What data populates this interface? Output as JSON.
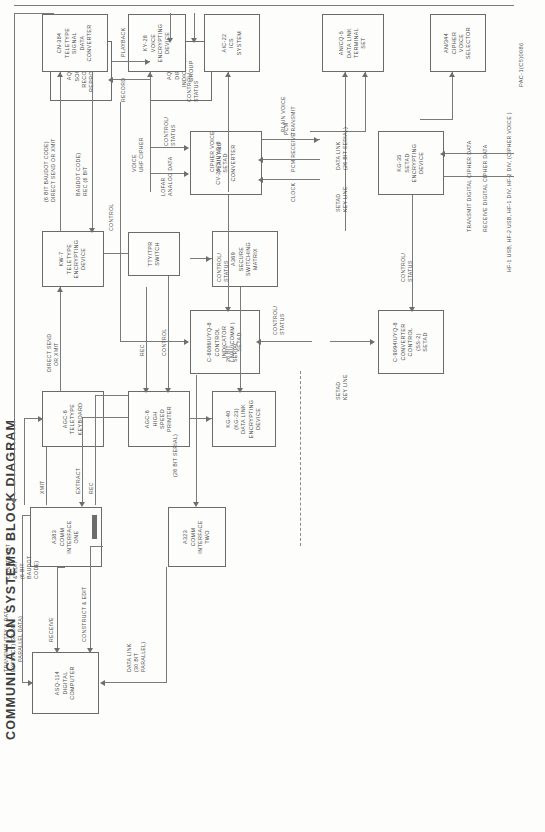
{
  "document": {
    "title": "COMMUNICATION SYSTEMS BLOCK DIAGRAM",
    "figure_code": "PAC-1(C5)0086"
  },
  "boxes": {
    "asq114": {
      "lines": [
        "ASQ-114",
        "DIGITAL",
        "COMPUTER"
      ]
    },
    "a383": {
      "lines": [
        "A383",
        "COMM",
        "INTERFACE",
        "ONE"
      ]
    },
    "a323": {
      "lines": [
        "A323",
        "COMM",
        "INTERFACE",
        "TWO"
      ]
    },
    "agc6kb": {
      "lines": [
        "AGC-6",
        "TELETYPE",
        "KEYBOARD"
      ]
    },
    "agc6pr": {
      "lines": [
        "AGC-6",
        "HIGH",
        "SPEED",
        "PRINTER"
      ]
    },
    "kg40": {
      "lines": [
        "KG-40",
        "(KG-23)",
        "DATA LINK",
        "ENCRYPTING",
        "DEVICE"
      ]
    },
    "kw7": {
      "lines": [
        "KW-7",
        "TELETYPE",
        "ENCRYPTING",
        "DEVICE"
      ]
    },
    "ttytpr": {
      "lines": [
        "TTY/TPR",
        "SWITCH"
      ]
    },
    "a369": {
      "lines": [
        "A369",
        "SECURE",
        "SWITCHING",
        "MATRIX"
      ]
    },
    "cn384": {
      "lines": [
        "CN-384",
        "TELETYPE",
        "SIGNAL",
        "DATA",
        "CONVERTER"
      ]
    },
    "ky28": {
      "lines": [
        "KY-28",
        "VOICE",
        "ENCRYPTING",
        "DEVICE"
      ]
    },
    "aic22": {
      "lines": [
        "AIC-22",
        "ICS",
        "SYSTEM"
      ]
    },
    "ancq5": {
      "lines": [
        "AN/CQ-5",
        "DATA LINK",
        "TERMINAL",
        "SET"
      ]
    },
    "an344": {
      "lines": [
        "AN/344",
        "CIPHER",
        "VOICE",
        "SELECTOR"
      ]
    },
    "c8086": {
      "lines": [
        "C-8086/UYQ-8",
        "CONTROL",
        "INDICATOR",
        "( NAV/COMM )",
        "SETAD"
      ]
    },
    "c9094": {
      "lines": [
        "C-9094/UYQ-8",
        "CONVERTER",
        "CONTROL",
        "(SS-2)",
        "SETAD"
      ]
    },
    "cv2975": {
      "lines": [
        "CV-2975/UYQ-8",
        "SETAD",
        "CONVERTER"
      ]
    },
    "kg35": {
      "lines": [
        "KG-35",
        "SETAD",
        "ENCRYPTING",
        "DEVICE"
      ]
    },
    "aqh4": {
      "lines": [
        "AQH-4",
        "SOUND",
        "RECORDER",
        "REPRODUCER"
      ]
    },
    "aqa7": {
      "lines": [
        "AQA-7",
        "DIFAR",
        "INDICATOR",
        "GROUP"
      ]
    }
  },
  "labels": {
    "transmit_tty_data": "TRANSMIT (TTY & DATA",
    "extract_30bit": "EXTRACT) (30 BIT",
    "parallel_data": "PARALLEL DATA)",
    "receive": "RECEIVE",
    "construct_edit": "CONSTRUCT & EDIT",
    "data_link_30bit": "DATA LINK",
    "data_link_30bit_2": "(30 BIT",
    "data_link_30bit_3": "PARALLEL)",
    "construct_edit_2a": "CONSTRUCT",
    "construct_edit_2b": "& EDIT",
    "baudot_16a": "(6 BIT",
    "baudot_16b": "BAUDOT",
    "baudot_16c": "CODE)",
    "xmit": "XMIT",
    "extract": "EXTRACT",
    "rec": "REC",
    "rec2": "REC",
    "direct_send_xmit_a": "DIRECT SEND",
    "direct_send_xmit_b": "OR XMIT",
    "control": "CONTROL",
    "control_b": "CONTROL",
    "ttytpr_control": "CONTROL",
    "bit26serial_a": "26 BIT",
    "bit26serial_b": "SERIAL",
    "bit26serial_paren": "(26 BIT SERIAL)",
    "setad_key_line_a": "SETAD",
    "setad_key_line_b": "KEY LINE",
    "setad_key_line2_a": "SETAD",
    "setad_key_line2_b": "KEY LINE",
    "data_link_26_a": "DATA LINK",
    "data_link_26_b": "(26 BIT SERIAL)",
    "direct_send_or_xmit_a": "DIRECT SEND OR XMIT",
    "direct_send_or_xmit_b": "(6 BIT BAUDOT CODE)",
    "rec_6bit_a": "REC (6 BIT",
    "rec_6bit_b": "BAUDOT CODE)",
    "uhf_cipher_a": "UHF CIPHER",
    "uhf_cipher_b": "VOICE",
    "plain_cipher_a": "PLAIN AND",
    "plain_cipher_b": "CIPHER VOICE",
    "plain_voice": "PLAIN VOICE",
    "control_status_1": "CONTROL/",
    "control_status_1b": "STATUS",
    "control_status_2": "CONTROL/",
    "control_status_2b": "STATUS",
    "control_status_3": "CONTROL/",
    "control_status_3b": "STATUS",
    "control_status_4": "CONTROL/",
    "control_status_4b": "STATUS",
    "control_status_5": "CONTROL/",
    "control_status_5b": "STATUS",
    "clock": "CLOCK",
    "pcm_receive": "PCM RECEIVE",
    "pcm_transmit_a": "PCM",
    "pcm_transmit_b": "TRANSMIT",
    "lofar_a": "LOFAR",
    "lofar_b": "ANALOG DATA",
    "playback": "PLAYBACK",
    "record": "RECORD",
    "transmit_cipher": "TRANSMIT DIGITAL CIPHER DATA",
    "receive_cipher": "RECEIVE DIGITAL CIPHER DATA",
    "hf_bus": "HF-1 USB, HF-2 USB, HF-1 DIV, HF-2 DIV, (CIPHER VOICE )"
  }
}
